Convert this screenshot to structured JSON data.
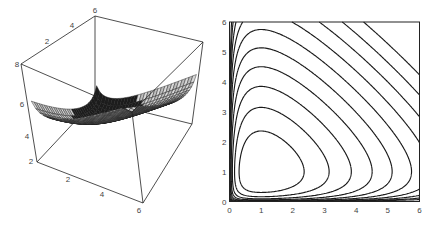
{
  "chart_data": [
    {
      "type": "surface3d",
      "title": "",
      "function": "z = x - ln(x) + y - ln(y)",
      "xlim": [
        0,
        6
      ],
      "ylim": [
        0,
        6
      ],
      "zlim": [
        2,
        8
      ],
      "x_ticks": [
        "2",
        "4",
        "6"
      ],
      "y_ticks": [
        "2",
        "4",
        "6"
      ],
      "z_ticks": [
        "2",
        "4",
        "6",
        "8"
      ],
      "grid_n": 30,
      "surface_light": "#d8d8d8",
      "surface_dark": "#1c1c1c",
      "minimum": {
        "x": 1,
        "y": 1,
        "z": 2
      }
    },
    {
      "type": "contour",
      "title": "",
      "function": "x - ln(x) + y - ln(y)",
      "xlim": [
        0,
        6
      ],
      "ylim": [
        0,
        6
      ],
      "x_ticks": [
        "0",
        "1",
        "2",
        "3",
        "4",
        "5",
        "6"
      ],
      "y_ticks": [
        "0",
        "1",
        "2",
        "3",
        "4",
        "5",
        "6"
      ],
      "levels": [
        2.5,
        3.0,
        3.5,
        4.0,
        4.5,
        5.0,
        5.5,
        6.0,
        6.5,
        7.0
      ],
      "line_color": "#1a1a1a",
      "center": {
        "x": 1,
        "y": 1
      }
    }
  ],
  "box3d": {
    "tick_labels": {
      "back_top": [
        "2",
        "4",
        "6"
      ],
      "left_vertical": [
        "8",
        "6",
        "4",
        "2"
      ],
      "front_bottom": [
        "2",
        "4",
        "6"
      ]
    }
  }
}
